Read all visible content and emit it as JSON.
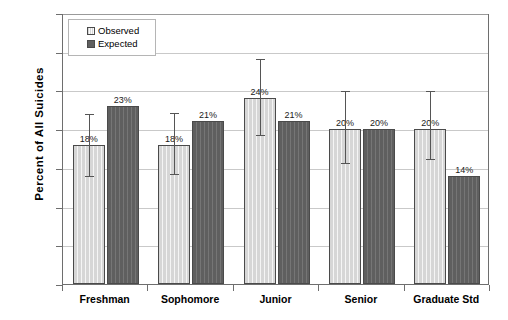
{
  "chart_data": {
    "type": "bar",
    "title": "",
    "xlabel": "",
    "ylabel": "Percent of All Suicides",
    "categories": [
      "Freshman",
      "Sophomore",
      "Junior",
      "Senior",
      "Graduate Std"
    ],
    "ylim": [
      0,
      35
    ],
    "ytick_values": [
      0,
      5,
      10,
      15,
      20,
      25,
      30,
      35
    ],
    "ytick_labels": [
      "0%",
      "5%",
      "10%",
      "15%",
      "20%",
      "25%",
      "30%",
      "35%"
    ],
    "grid": true,
    "legend_position": "top-left",
    "series": [
      {
        "name": "Observed",
        "color": "#d6d6d6",
        "values": [
          18,
          18,
          24,
          20,
          20
        ],
        "data_labels": [
          "18%",
          "18%",
          "24%",
          "20%",
          "20%"
        ],
        "error_low": [
          14.0,
          14.2,
          19.2,
          15.6,
          16.1
        ],
        "error_high": [
          22.1,
          22.2,
          29.2,
          25.0,
          25.0
        ]
      },
      {
        "name": "Expected",
        "color": "#5f5f5f",
        "values": [
          23,
          21,
          21,
          20,
          14
        ],
        "data_labels": [
          "23%",
          "21%",
          "21%",
          "20%",
          "14%"
        ],
        "error_low": [
          null,
          null,
          null,
          null,
          null
        ],
        "error_high": [
          null,
          null,
          null,
          null,
          null
        ]
      }
    ]
  },
  "legend": {
    "items": [
      {
        "label": "Observed",
        "swatch": "observed-swatch-icon"
      },
      {
        "label": "Expected",
        "swatch": "expected-swatch-icon"
      }
    ]
  },
  "axis": {
    "y_title": "Percent of All Suicides"
  }
}
